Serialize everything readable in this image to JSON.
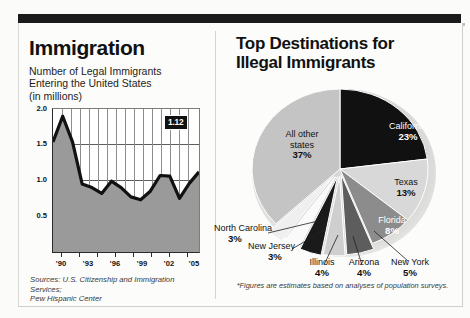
{
  "left_panel": {
    "title": "Immigration",
    "subtitle": "Number of Legal Immigrants\nEntering the United States\n(in millions)",
    "source": "Sources: U.S. Citizenship and Immigration Services;\nPew Hispanic Center",
    "callout_value": "1.12"
  },
  "right_panel": {
    "title": "Top Destinations for\nIllegal Immigrants",
    "footnote": "*Figures are estimates based on analyses of population surveys."
  },
  "chart_data": [
    {
      "type": "area",
      "title": "Immigration",
      "subtitle": "Number of Legal Immigrants Entering the United States (in millions)",
      "xlabel": "",
      "ylabel": "millions",
      "ylim": [
        0.0,
        2.0
      ],
      "yticks": [
        "2.0",
        "1.5",
        "1.0",
        "0.5"
      ],
      "ytick_values": [
        2.0,
        1.5,
        1.0,
        0.5
      ],
      "xticks": [
        "'90",
        "'93",
        "'96",
        "'99",
        "'02",
        "'05"
      ],
      "grid": true,
      "x": [
        1990,
        1991,
        1992,
        1993,
        1994,
        1995,
        1996,
        1997,
        1998,
        1999,
        2000,
        2001,
        2002,
        2003,
        2004,
        2005
      ],
      "values": [
        1.54,
        1.9,
        1.54,
        0.95,
        0.9,
        0.82,
        0.99,
        0.9,
        0.77,
        0.73,
        0.85,
        1.07,
        1.06,
        0.75,
        0.96,
        1.12
      ],
      "annotation": "1.12",
      "annotation_x": 2005,
      "annotation_y": 1.12
    },
    {
      "type": "pie",
      "title": "Top Destinations for Illegal Immigrants",
      "footnote": "*Figures are estimates based on analyses of population surveys.",
      "categories": [
        "California",
        "Texas",
        "Florida",
        "New York",
        "Arizona",
        "Illinois",
        "New Jersey",
        "North Carolina",
        "All other states"
      ],
      "values": [
        23,
        13,
        8,
        5,
        4,
        4,
        3,
        3,
        37
      ],
      "labels": [
        "23%",
        "13%",
        "8%",
        "5%",
        "4%",
        "4%",
        "3%",
        "3%",
        "37%"
      ],
      "legend": "on-slice"
    }
  ],
  "pie_labels": [
    {
      "name": "California",
      "pct": "23%"
    },
    {
      "name": "Texas",
      "pct": "13%"
    },
    {
      "name": "Florida",
      "pct": "8%"
    },
    {
      "name": "New York",
      "pct": "5%"
    },
    {
      "name": "Arizona",
      "pct": "4%"
    },
    {
      "name": "Illinois",
      "pct": "4%"
    },
    {
      "name": "New Jersey",
      "pct": "3%"
    },
    {
      "name": "North Carolina",
      "pct": "3%"
    },
    {
      "name": "All other\nstates",
      "pct": "37%"
    }
  ],
  "colors": {
    "bar": "#1b1b1b",
    "area_fill": "#9a9a9a",
    "line": "#111111",
    "pie_california": "#111111",
    "pie_texas": "#d8d8d8",
    "pie_florida": "#8c8c8c",
    "pie_other": "#c4c4c4"
  }
}
